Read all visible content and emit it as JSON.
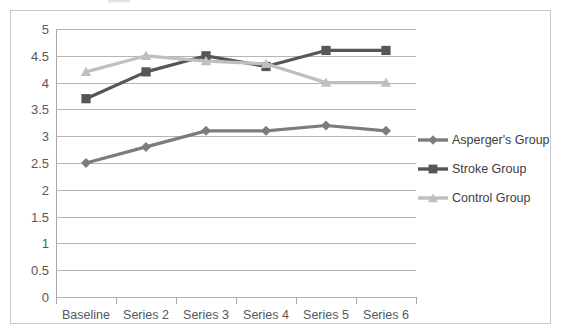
{
  "chart_data": {
    "type": "line",
    "title": "",
    "xlabel": "",
    "ylabel": "",
    "categories": [
      "Baseline",
      "Series 2",
      "Series 3",
      "Series 4",
      "Series 5",
      "Series 6"
    ],
    "ylim": [
      0,
      5
    ],
    "ytick_step": 0.5,
    "yticks": [
      "5",
      "4.5",
      "4",
      "3.5",
      "3",
      "2.5",
      "2",
      "1.5",
      "1",
      "0.5",
      "0"
    ],
    "grid": true,
    "legend_position": "right",
    "series": [
      {
        "name": "Asperger's Group",
        "color": "#7c7c7e",
        "marker": "diamond",
        "values": [
          2.5,
          2.8,
          3.1,
          3.1,
          3.2,
          3.1
        ]
      },
      {
        "name": "Stroke Group",
        "color": "#565658",
        "marker": "square",
        "values": [
          3.7,
          4.2,
          4.5,
          4.3,
          4.6,
          4.6
        ]
      },
      {
        "name": "Control Group",
        "color": "#bfbfbf",
        "marker": "triangle",
        "values": [
          4.2,
          4.5,
          4.4,
          4.35,
          4.0,
          4.0
        ]
      }
    ]
  },
  "legend": {
    "items": [
      {
        "label": "Asperger's Group"
      },
      {
        "label": "Stroke Group"
      },
      {
        "label": "Control Group"
      }
    ]
  },
  "colors": {
    "aspergers": "#7c7c7e",
    "stroke": "#565658",
    "control": "#bfbfbf",
    "gridline": "#b5b5b5",
    "axis": "#a8a8a8",
    "tick_text": "#58585a",
    "frame": "#c9c9c9"
  }
}
